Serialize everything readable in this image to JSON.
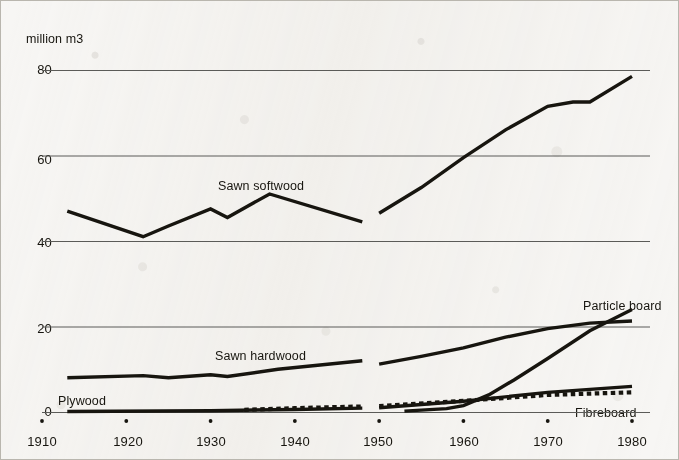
{
  "figure": {
    "unit_label": "million m3",
    "background_color": "#f7f6f4",
    "ink_color": "#17150f",
    "gridline_color": "#5b5b58"
  },
  "axes": {
    "y_ticks": [
      "0",
      "20",
      "40",
      "60",
      "80"
    ],
    "x_ticks": [
      "1910",
      "1920",
      "1930",
      "1940",
      "1950",
      "1960",
      "1970",
      "1980"
    ]
  },
  "series_labels": {
    "sawn_softwood": "Sawn softwood",
    "sawn_hardwood": "Sawn hardwood",
    "particle_board": "Particle board",
    "plywood": "Plywood",
    "fibreboard": "Fibreboard"
  },
  "chart_data": {
    "type": "line",
    "title": "",
    "xlabel": "",
    "ylabel": "million m3",
    "xlim": [
      1910,
      1980
    ],
    "ylim": [
      0,
      80
    ],
    "yticks": [
      0,
      20,
      40,
      60,
      80
    ],
    "xticks": [
      1910,
      1920,
      1930,
      1940,
      1950,
      1960,
      1970,
      1980
    ],
    "grid": "horizontal",
    "legend": "inline-labels",
    "note": "Series are broken between 1948 and 1950 (war-time data gap).",
    "series": [
      {
        "name": "Sawn softwood",
        "style": "solid-thick",
        "segments": [
          {
            "x": [
              1913,
              1922,
              1925,
              1930,
              1932,
              1937,
              1948
            ],
            "y": [
              47.0,
              41.0,
              43.5,
              47.5,
              45.5,
              51.0,
              44.5
            ]
          },
          {
            "x": [
              1950,
              1955,
              1960,
              1965,
              1970,
              1973,
              1975,
              1980
            ],
            "y": [
              46.5,
              52.5,
              59.5,
              66.0,
              71.5,
              72.5,
              72.5,
              78.5
            ]
          }
        ]
      },
      {
        "name": "Sawn hardwood",
        "style": "solid-thick",
        "segments": [
          {
            "x": [
              1913,
              1922,
              1925,
              1930,
              1932,
              1938,
              1948
            ],
            "y": [
              8.0,
              8.5,
              8.0,
              8.7,
              8.3,
              10.0,
              12.0
            ]
          },
          {
            "x": [
              1950,
              1955,
              1960,
              1965,
              1970,
              1975,
              1980
            ],
            "y": [
              11.2,
              13.0,
              15.0,
              17.5,
              19.5,
              20.8,
              21.3
            ]
          }
        ]
      },
      {
        "name": "Particle board",
        "style": "solid-thick",
        "segments": [
          {
            "x": [
              1953,
              1958,
              1960,
              1963,
              1966,
              1970,
              1975,
              1980
            ],
            "y": [
              0.2,
              0.8,
              1.5,
              4.0,
              7.5,
              12.5,
              19.0,
              24.0
            ]
          }
        ]
      },
      {
        "name": "Plywood",
        "style": "solid-thick",
        "segments": [
          {
            "x": [
              1913,
              1930,
              1940,
              1948
            ],
            "y": [
              0.1,
              0.3,
              0.6,
              0.9
            ]
          },
          {
            "x": [
              1950,
              1960,
              1970,
              1980
            ],
            "y": [
              1.0,
              2.5,
              4.6,
              6.0
            ]
          }
        ]
      },
      {
        "name": "Fibreboard",
        "style": "dashed-thick",
        "segments": [
          {
            "x": [
              1934,
              1940,
              1948
            ],
            "y": [
              0.5,
              0.9,
              1.3
            ]
          },
          {
            "x": [
              1950,
              1960,
              1970,
              1980
            ],
            "y": [
              1.4,
              2.6,
              4.0,
              4.6
            ]
          }
        ]
      }
    ]
  }
}
